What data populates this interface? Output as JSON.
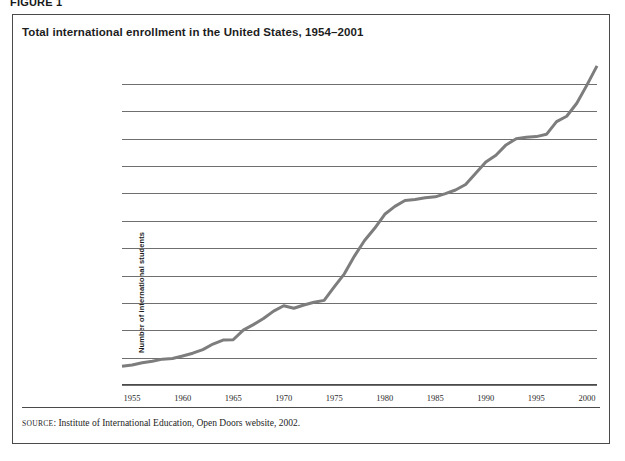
{
  "figure": {
    "label": "FIGURE 1"
  },
  "chart_title": "Total international enrollment in the United States, 1954–2001",
  "source": {
    "prefix": "SOURCE",
    "separator": ": ",
    "text": "Institute of International Education, Open Doors website, 2002."
  },
  "colors": {
    "line": "#7d7d7d",
    "grid": "#6f6f6f",
    "axis": "#4a4a4a",
    "border": "#4a4a4a",
    "text": "#1d1d1d",
    "background": "#ffffff"
  },
  "chart_data": {
    "type": "line",
    "title": "Total international enrollment in the United States, 1954–2001",
    "xlabel": "",
    "ylabel": "Number of international students",
    "xlim": [
      1954,
      2001
    ],
    "ylim": [
      0,
      570000
    ],
    "grid": true,
    "legend": false,
    "ytick_labels": [
      "0",
      "50,000",
      "100,000",
      "150,000",
      "200,000",
      "250,000",
      "300,000",
      "350,000",
      "400,000",
      "450,000",
      "500,000",
      "550,000"
    ],
    "ytick_values": [
      0,
      50000,
      100000,
      150000,
      200000,
      250000,
      300000,
      350000,
      400000,
      450000,
      500000,
      550000
    ],
    "xtick_labels": [
      "1955",
      "1960",
      "1965",
      "1970",
      "1975",
      "1980",
      "1985",
      "1990",
      "1995",
      "2000"
    ],
    "xtick_values": [
      1955,
      1960,
      1965,
      1970,
      1975,
      1980,
      1985,
      1990,
      1995,
      2000
    ],
    "series": [
      {
        "name": "Total international enrollment",
        "x": [
          1954,
          1955,
          1956,
          1957,
          1958,
          1959,
          1960,
          1961,
          1962,
          1963,
          1964,
          1965,
          1966,
          1967,
          1968,
          1969,
          1970,
          1971,
          1972,
          1973,
          1974,
          1975,
          1976,
          1977,
          1978,
          1979,
          1980,
          1981,
          1982,
          1983,
          1984,
          1985,
          1986,
          1987,
          1988,
          1989,
          1990,
          1991,
          1992,
          1993,
          1994,
          1995,
          1996,
          1997,
          1998,
          1999,
          2000,
          2001
        ],
        "values": [
          34232,
          36494,
          40666,
          43391,
          47245,
          48486,
          53107,
          58086,
          64705,
          74814,
          82045,
          82709,
          100262,
          110315,
          121362,
          134959,
          144708,
          140126,
          146097,
          151066,
          154580,
          179344,
          203068,
          235509,
          263938,
          286343,
          311882,
          326299,
          336990,
          338894,
          342113,
          343777,
          349609,
          356187,
          366354,
          386851,
          407529,
          419585,
          438618,
          449749,
          452635,
          453787,
          457984,
          481280,
          490933,
          514723,
          547867,
          582996
        ]
      }
    ],
    "annotations": [
      "Slow steady growth from about 34,000 in 1954 to roughly 82,000 in 1965",
      "Plateau near 145,000–155,000 during 1970–1974",
      "Rapid rise from about 155,000 in 1974 to roughly 312,000 in 1980",
      "Flat stretch near 337,000–356,000 during 1982–1987",
      "Brief plateau near 450,000–458,000 during 1993–1996",
      "Steep climb to about 548,000 in 2000"
    ]
  }
}
